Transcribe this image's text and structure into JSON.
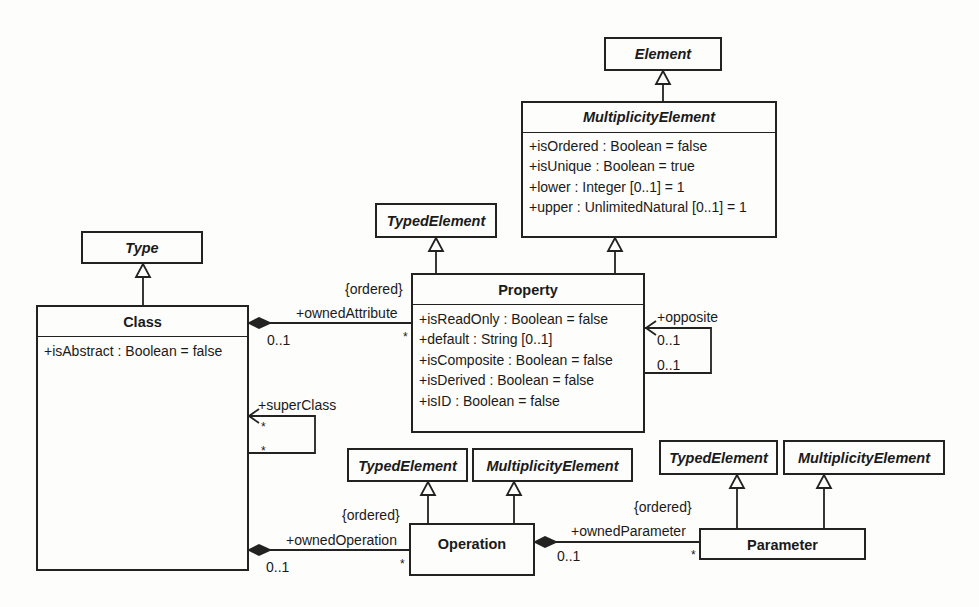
{
  "diagram": {
    "type": "UML class diagram",
    "colors": {
      "line": "#222222",
      "background": "#fdfdfb",
      "text": "#1a1a1a"
    }
  },
  "classes": {
    "element": {
      "name": "Element",
      "abstract": true
    },
    "multiplicity_element": {
      "name": "MultiplicityElement",
      "abstract": true,
      "attributes": [
        "+isOrdered : Boolean = false",
        "+isUnique : Boolean = true",
        "+lower : Integer [0..1] = 1",
        "+upper : UnlimitedNatural [0..1] = 1"
      ]
    },
    "typed_element_property": {
      "name": "TypedElement",
      "abstract": true
    },
    "type": {
      "name": "Type",
      "abstract": true
    },
    "property": {
      "name": "Property",
      "abstract": false,
      "attributes": [
        "+isReadOnly : Boolean = false",
        "+default : String [0..1]",
        "+isComposite : Boolean = false",
        "+isDerived : Boolean = false",
        "+isID : Boolean = false"
      ]
    },
    "class": {
      "name": "Class",
      "abstract": false,
      "attributes": [
        "+isAbstract : Boolean = false"
      ]
    },
    "typed_element_operation": {
      "name": "TypedElement",
      "abstract": true
    },
    "multiplicity_element_operation": {
      "name": "MultiplicityElement",
      "abstract": true
    },
    "operation": {
      "name": "Operation",
      "abstract": false
    },
    "typed_element_parameter": {
      "name": "TypedElement",
      "abstract": true
    },
    "multiplicity_element_parameter": {
      "name": "MultiplicityElement",
      "abstract": true
    },
    "parameter": {
      "name": "Parameter",
      "abstract": false
    }
  },
  "associations": {
    "owned_attribute": {
      "role": "+ownedAttribute",
      "constraint": "{ordered}",
      "owner_mult": "0..1",
      "part_mult": "*"
    },
    "opposite": {
      "role": "+opposite",
      "mult_1": "0..1",
      "mult_2": "0..1"
    },
    "super_class": {
      "role": "+superClass",
      "mult_1": "*",
      "mult_2": "*"
    },
    "owned_operation": {
      "role": "+ownedOperation",
      "constraint": "{ordered}",
      "owner_mult": "0..1",
      "part_mult": "*"
    },
    "owned_parameter": {
      "role": "+ownedParameter",
      "constraint": "{ordered}",
      "owner_mult": "0..1",
      "part_mult": "*"
    }
  }
}
